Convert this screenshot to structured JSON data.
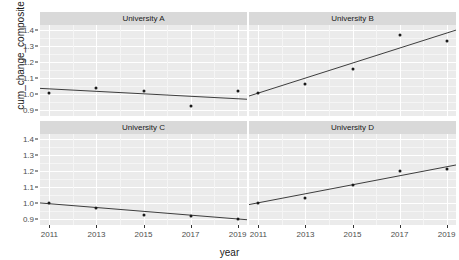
{
  "chart_data": {
    "type": "scatter",
    "title": "",
    "xlabel": "year",
    "ylabel": "cum_change_composite",
    "x": [
      2011,
      2013,
      2015,
      2017,
      2019
    ],
    "xlim": [
      2010.6,
      2019.4
    ],
    "ylim": [
      0.86,
      1.43
    ],
    "xticks": [
      "2011",
      "2013",
      "2015",
      "2017",
      "2019"
    ],
    "yticks": [
      "0.9",
      "1.0",
      "1.1",
      "1.2",
      "1.3",
      "1.4"
    ],
    "ytickvalues": [
      0.9,
      1.0,
      1.1,
      1.2,
      1.3,
      1.4
    ],
    "grid": true,
    "legend": "none",
    "facet_layout": "2x2",
    "panels": [
      {
        "label": "University A",
        "values": [
          1.005,
          1.035,
          1.018,
          0.925,
          1.015
        ],
        "fit": {
          "y_start": 1.033,
          "y_end": 0.965
        }
      },
      {
        "label": "University B",
        "values": [
          1.005,
          1.058,
          1.155,
          1.367,
          1.327
        ],
        "fit": {
          "y_start": 0.985,
          "y_end": 1.398
        }
      },
      {
        "label": "University C",
        "values": [
          1.0,
          0.968,
          0.921,
          0.916,
          0.895
        ],
        "fit": {
          "y_start": 0.998,
          "y_end": 0.893
        }
      },
      {
        "label": "University D",
        "values": [
          0.997,
          1.031,
          1.11,
          1.196,
          1.212
        ],
        "fit": {
          "y_start": 0.988,
          "y_end": 1.236
        }
      }
    ],
    "colors": {
      "panel_background": "#ebebeb",
      "strip_background": "#d9d9d9",
      "grid_major": "#ffffff",
      "point": "#1a1a1a",
      "line": "#3d3d3d",
      "text": "#1a1a1a",
      "tick_text": "#4d4d4d"
    }
  }
}
